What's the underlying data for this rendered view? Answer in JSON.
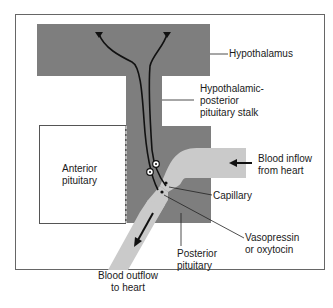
{
  "diagram": {
    "colors": {
      "tissue_dark": "#7d7d7d",
      "vessel_light": "#c9c9c9",
      "frame": "#555555",
      "background": "#ffffff",
      "line": "#1a1a1a"
    },
    "labels": {
      "hypothalamus": "Hypothalamus",
      "stalk_line1": "Hypothalamic-",
      "stalk_line2": "posterior",
      "stalk_line3": "pituitary stalk",
      "anterior_line1": "Anterior",
      "anterior_line2": "pituitary",
      "inflow_line1": "Blood inflow",
      "inflow_line2": "from heart",
      "capillary": "Capillary",
      "hormone_line1": "Vasopressin",
      "hormone_line2": "or oxytocin",
      "posterior_line1": "Posterior",
      "posterior_line2": "pituitary",
      "outflow_line1": "Blood outflow",
      "outflow_line2": "to heart"
    },
    "structures": [
      "hypothalamus",
      "hypothalamic-posterior-pituitary-stalk",
      "anterior-pituitary",
      "posterior-pituitary",
      "capillary",
      "blood-inflow-vessel",
      "blood-outflow-vessel",
      "neurosecretory-neurons"
    ]
  }
}
